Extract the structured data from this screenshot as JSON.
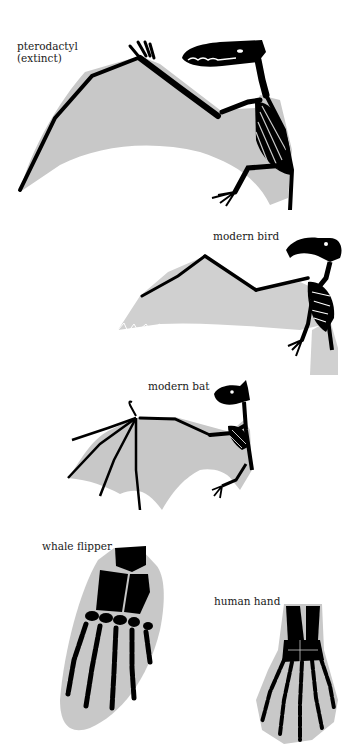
{
  "figure": {
    "colors": {
      "background": "#ffffff",
      "membrane": "#c8c8c8",
      "bone": "#000000",
      "label": "#1a1a1a"
    },
    "specimens": [
      {
        "id": "pterodactyl",
        "label_line1": "pterodactyl",
        "label_line2": "(extinct)"
      },
      {
        "id": "bird",
        "label_line1": "modern bird"
      },
      {
        "id": "bat",
        "label_line1": "modern bat"
      },
      {
        "id": "whale",
        "label_line1": "whale flipper"
      },
      {
        "id": "human",
        "label_line1": "human hand"
      }
    ]
  }
}
